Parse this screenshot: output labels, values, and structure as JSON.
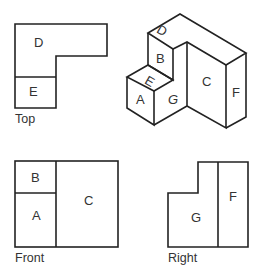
{
  "views": {
    "top": {
      "caption": "Top",
      "faces": [
        "D",
        "E"
      ]
    },
    "isometric": {
      "faces": [
        "A",
        "B",
        "C",
        "D",
        "E",
        "F",
        "G"
      ]
    },
    "front": {
      "caption": "Front",
      "faces": [
        "B",
        "A",
        "C"
      ]
    },
    "right": {
      "caption": "Right",
      "faces": [
        "G",
        "F"
      ]
    }
  }
}
